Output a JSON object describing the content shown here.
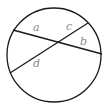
{
  "diagram": {
    "type": "circle-intersecting-chords",
    "circle": {
      "cx": 54,
      "cy": 55,
      "r": 47
    },
    "chords": [
      {
        "x1": 13,
        "y1": 30,
        "x2": 102,
        "y2": 54
      },
      {
        "x1": 10,
        "y1": 73,
        "x2": 88,
        "y2": 23
      }
    ],
    "labels": {
      "a": "a",
      "b": "b",
      "c": "c",
      "d": "d"
    },
    "colors": {
      "stroke": "#1a1a1a",
      "label": "#8a8a8a"
    }
  }
}
